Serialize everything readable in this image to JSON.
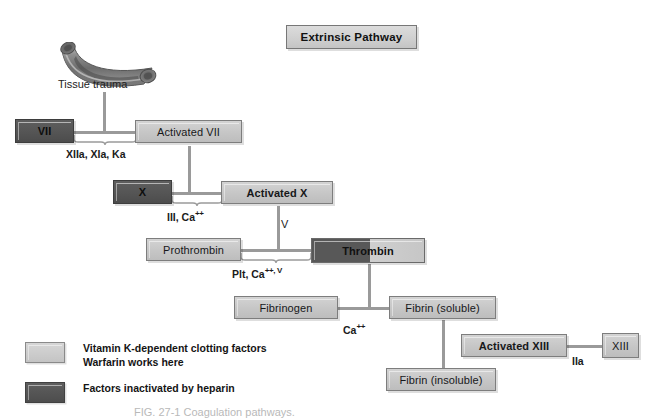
{
  "figure": {
    "title": "Extrinsic Pathway",
    "caption": "FIG. 27-1 Coagulation pathways."
  },
  "illustration": {
    "vessel_icon": "blood-vessel-icon",
    "vessel_label": "Tissue trauma"
  },
  "nodes": {
    "factor_vii": {
      "label": "VII",
      "style": "dark"
    },
    "activated_vii": {
      "label": "Activated VII",
      "style": "light"
    },
    "factor_x": {
      "label": "X",
      "style": "dark"
    },
    "activated_x": {
      "label": "Activated X",
      "style": "light"
    },
    "prothrombin": {
      "label": "Prothrombin",
      "style": "light"
    },
    "thrombin": {
      "label": "Thrombin",
      "style": "split"
    },
    "fibrinogen": {
      "label": "Fibrinogen",
      "style": "light"
    },
    "fibrin_soluble": {
      "label": "Fibrin (soluble)",
      "style": "light"
    },
    "fibrin_insoluble": {
      "label": "Fibrin (insoluble)",
      "style": "light"
    },
    "activated_xiii": {
      "label": "Activated XIII",
      "style": "light"
    },
    "factor_xiii": {
      "label": "XIII",
      "style": "light"
    }
  },
  "cofactors": {
    "vii_activation": "XIIa, XIa, Ka",
    "x_activation_1": "III, Ca",
    "x_activation_2": "++",
    "thrombin_v": "V",
    "prothrombin_1": "Plt, Ca",
    "prothrombin_2": "++, V",
    "fibrin_1": "Ca",
    "fibrin_2": "++",
    "xiii_activation": "IIa"
  },
  "legend": {
    "items": [
      {
        "swatch": "light",
        "line1": "Vitamin K-dependent clotting factors",
        "line2": "Warfarin works here"
      },
      {
        "swatch": "dark",
        "line1": "Factors inactivated by heparin",
        "line2": ""
      }
    ]
  },
  "colors": {
    "light_factor": "#c6c6c6",
    "dark_factor": "#555555",
    "connector": "#9a9a9a",
    "title_bg": "#cfcfcf"
  }
}
